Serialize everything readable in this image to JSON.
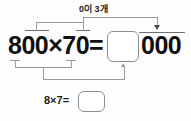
{
  "diagram": {
    "type": "math-decomposition",
    "language": "ko",
    "top_label": "0이 3개",
    "main_expression": "800×70=",
    "tail_zeros": "000",
    "sub_expression": "8×7=",
    "product_box_value": "",
    "product_box_placeholder": "",
    "sub_box_value": "",
    "sub_box_placeholder": "",
    "icons": {
      "top_arrow": "arrow-down-icon",
      "bottom_arrow": "arrow-up-icon"
    },
    "colors": {
      "text": "#111111",
      "connector": "#9a9a9a",
      "box_border": "#8e8e8e",
      "arrow": "#4a4a4a",
      "background": "#ffffff"
    }
  }
}
